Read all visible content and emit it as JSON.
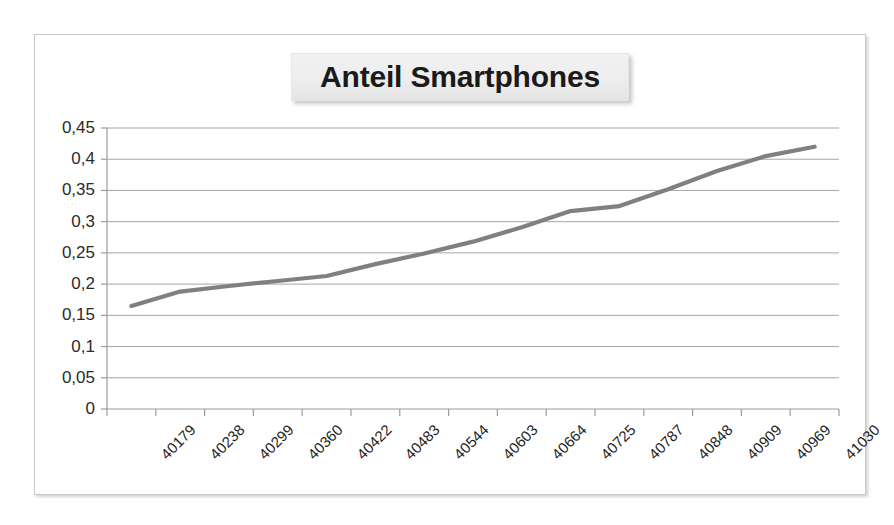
{
  "chart_data": {
    "type": "line",
    "title": "Anteil Smartphones",
    "xlabel": "",
    "ylabel": "",
    "grid": true,
    "legend": false,
    "legend_position": "none",
    "decimal_separator": ",",
    "series_color": "#808080",
    "categories": [
      "40179",
      "40238",
      "40299",
      "40360",
      "40422",
      "40483",
      "40544",
      "40603",
      "40664",
      "40725",
      "40787",
      "40848",
      "40909",
      "40969",
      "41030"
    ],
    "x_tick_labels": [
      "40179",
      "40238",
      "40299",
      "40360",
      "40422",
      "40483",
      "40544",
      "40603",
      "40664",
      "40725",
      "40787",
      "40848",
      "40909",
      "40969",
      "41030"
    ],
    "y_tick_labels": [
      "0,45",
      "0,4",
      "0,35",
      "0,3",
      "0,25",
      "0,2",
      "0,15",
      "0,1",
      "0,05",
      "0"
    ],
    "y_tick_values": [
      0.45,
      0.4,
      0.35,
      0.3,
      0.25,
      0.2,
      0.15,
      0.1,
      0.05,
      0
    ],
    "ylim": [
      0,
      0.45
    ],
    "series": [
      {
        "name": "Anteil Smartphones",
        "values": [
          0.165,
          0.188,
          0.197,
          0.205,
          0.213,
          0.232,
          0.249,
          0.268,
          0.291,
          0.317,
          0.325,
          0.352,
          0.381,
          0.405,
          0.42
        ]
      }
    ],
    "points": [
      {
        "x": "40179",
        "y": 0.165
      },
      {
        "x": "40238",
        "y": 0.188
      },
      {
        "x": "40299",
        "y": 0.197
      },
      {
        "x": "40360",
        "y": 0.205
      },
      {
        "x": "40422",
        "y": 0.213
      },
      {
        "x": "40483",
        "y": 0.232
      },
      {
        "x": "40544",
        "y": 0.249
      },
      {
        "x": "40603",
        "y": 0.268
      },
      {
        "x": "40664",
        "y": 0.291
      },
      {
        "x": "40725",
        "y": 0.317
      },
      {
        "x": "40787",
        "y": 0.325
      },
      {
        "x": "40848",
        "y": 0.352
      },
      {
        "x": "40909",
        "y": 0.381
      },
      {
        "x": "40969",
        "y": 0.405
      },
      {
        "x": "41030",
        "y": 0.42
      }
    ]
  },
  "colors": {
    "line": "#808080",
    "gridline": "#a6a6a6",
    "axis": "#9c9c9c",
    "frame_border": "#c8c8c8",
    "title_background": "#ededed",
    "text": "#1f1f1f"
  }
}
